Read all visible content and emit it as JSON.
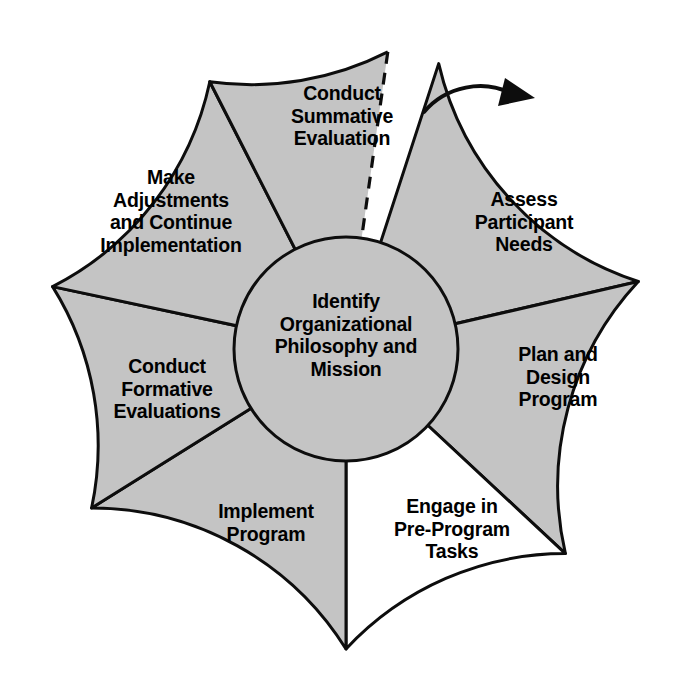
{
  "diagram": {
    "type": "cyclical-wheel",
    "colors": {
      "segment_fill": "#c4c4c4",
      "segment_fill_highlight": "#ffffff",
      "stroke": "#0d0d0d",
      "background": "#ffffff",
      "text": "#000000"
    },
    "geometry": {
      "center_x": 346,
      "center_y": 349,
      "outer_radius": 300,
      "inner_radius": 112
    },
    "hub": {
      "label": "Identify\nOrganizational\nPhilosophy and\nMission"
    },
    "segments": [
      {
        "id": "assess-participant-needs",
        "label": "Assess\nParticipant\nNeeds",
        "fill": "#c4c4c4",
        "start_angle": 72,
        "end_angle": 13,
        "order": 1
      },
      {
        "id": "plan-and-design-program",
        "label": "Plan and\nDesign\nProgram",
        "fill": "#c4c4c4",
        "start_angle": 13,
        "end_angle": -43,
        "order": 2
      },
      {
        "id": "engage-in-pre-program-tasks",
        "label": "Engage in\nPre-Program\nTasks",
        "fill": "#ffffff",
        "start_angle": -43,
        "end_angle": -90,
        "order": 3
      },
      {
        "id": "implement-program",
        "label": "Implement\nProgram",
        "fill": "#c4c4c4",
        "start_angle": -90,
        "end_angle": -148,
        "order": 4
      },
      {
        "id": "conduct-formative-evaluations",
        "label": "Conduct\nFormative\nEvaluations",
        "fill": "#c4c4c4",
        "start_angle": -148,
        "end_angle": -192,
        "order": 5
      },
      {
        "id": "make-adjustments-and-continue-implementation",
        "label": "Make\nAdjustments\nand Continue\nImplementation",
        "fill": "#c4c4c4",
        "start_angle": 168,
        "end_angle": 117,
        "order": 6
      },
      {
        "id": "conduct-summative-evaluation",
        "label": "Conduct\nSummative\nEvaluation",
        "fill": "#c4c4c4",
        "start_angle": 117,
        "end_angle": 82,
        "order": 7
      }
    ],
    "cycle_arrow": {
      "name": "cycle-continuation-arrow",
      "description": "curved arrow over the gap pointing clockwise into Assess Participant Needs"
    },
    "gap": {
      "name": "cycle-gap",
      "description": "white wedge gap between Conduct Summative Evaluation and Assess Participant Needs with dashed edge"
    }
  }
}
